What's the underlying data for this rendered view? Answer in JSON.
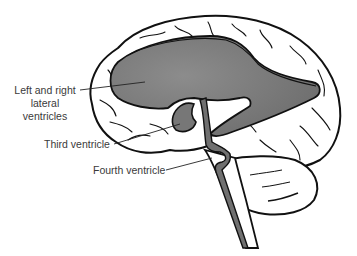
{
  "figure": {
    "colors": {
      "background": "#ffffff",
      "outline": "#111111",
      "ventricle_fill": "#7a7a7a",
      "ventricle_rim": "#5a5a5a",
      "label_text": "#3a3a3a"
    }
  },
  "labels": {
    "lateral_line1": "Left and right",
    "lateral_line2": "lateral",
    "lateral_line3": "ventricles",
    "third": "Third ventricle",
    "fourth": "Fourth ventricle"
  }
}
